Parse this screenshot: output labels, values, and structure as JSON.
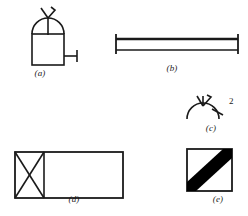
{
  "plate": {
    "background_color": "#ffffff",
    "ink_color": "#1a1a1a",
    "width": 248,
    "height": 216,
    "figure_count": 5
  },
  "figures": [
    {
      "id": "a",
      "caption": "(a)",
      "description": "square vessel body with semicircular dome top and forked antenna, side spigot stub",
      "stroke_color": "#1a1a1a",
      "stroke_width": 1.6
    },
    {
      "id": "b",
      "caption": "(b)",
      "description": "long horizontal bar with thick upper rail and vertical end caps",
      "stroke_color": "#1a1a1a",
      "stroke_width": 1.6
    },
    {
      "id": "c",
      "caption": "(c)",
      "description": "shallow arc with forked antenna and tick mark",
      "stroke_color": "#1a1a1a",
      "stroke_width": 1.6,
      "number_label": "2"
    },
    {
      "id": "d",
      "caption": "(d)",
      "description": "wide rectangle with bowtie cross pattern in left-hand square panel",
      "stroke_color": "#1a1a1a",
      "stroke_width": 1.6
    },
    {
      "id": "e",
      "caption": "(e)",
      "description": "square with thick solid black diagonal band from lower-left to upper-right",
      "stroke_color": "#1a1a1a",
      "fill_color": "#000000",
      "stroke_width": 1.6
    }
  ]
}
